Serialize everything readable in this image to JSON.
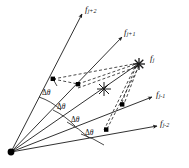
{
  "figure": {
    "colors": {
      "line": "#1a1a1a",
      "dashed": "#1a1a1a",
      "background": "#ffffff",
      "node": "#000000"
    },
    "origin_label": "origin-vertex",
    "rays": [
      {
        "id": "ray-jp2",
        "label": "f",
        "sub": "j+2",
        "tip_marker": "arrow"
      },
      {
        "id": "ray-jp1",
        "label": "f",
        "sub": "j+1",
        "tip_marker": "arrow"
      },
      {
        "id": "ray-j",
        "label": "f",
        "sub": "j",
        "tip_marker": "star"
      },
      {
        "id": "ray-jm1",
        "label": "f",
        "sub": "j-1",
        "tip_marker": "arrow"
      },
      {
        "id": "ray-jm2",
        "label": "f",
        "sub": "j-2",
        "tip_marker": "arrow"
      }
    ],
    "angles": [
      {
        "id": "angle-1",
        "text": "Δ",
        "symbol": "θ"
      },
      {
        "id": "angle-2",
        "text": "Δ",
        "symbol": "θ"
      },
      {
        "id": "angle-3",
        "text": "Δ",
        "symbol": "θ"
      },
      {
        "id": "angle-4",
        "text": "Δ",
        "symbol": "θ"
      }
    ],
    "markers": {
      "center_star": "star-marker-center",
      "fj_star": "star-marker-fj"
    }
  }
}
